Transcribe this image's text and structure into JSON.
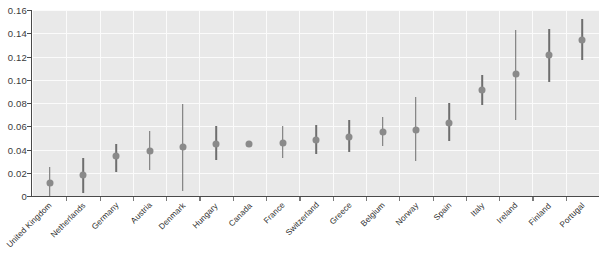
{
  "chart_data": {
    "type": "scatter",
    "title": "",
    "subtitle": "",
    "xlabel": "",
    "ylabel": "",
    "ylim": [
      0,
      0.16
    ],
    "ytick_labels": [
      "0",
      "0.02",
      "0.04",
      "0.06",
      "0.08",
      "0.10",
      "0.12",
      "0.14",
      "0.16"
    ],
    "ytick_values": [
      0,
      0.02,
      0.04,
      0.06,
      0.08,
      0.1,
      0.12,
      0.14,
      0.16
    ],
    "grid": true,
    "legend": "none",
    "categories": [
      "United Kingdom",
      "Netherlands",
      "Germany",
      "Austria",
      "Denmark",
      "Hungary",
      "Canada",
      "France",
      "Switzerland",
      "Greece",
      "Belgium",
      "Norway",
      "Spain",
      "Italy",
      "Ireland",
      "Finland",
      "Portugal"
    ],
    "values": [
      0.011,
      0.018,
      0.034,
      0.039,
      0.042,
      0.045,
      0.045,
      0.046,
      0.048,
      0.051,
      0.055,
      0.057,
      0.063,
      0.091,
      0.105,
      0.121,
      0.134
    ],
    "error_low": [
      0.0,
      0.003,
      0.021,
      0.022,
      0.004,
      0.031,
      0.043,
      0.033,
      0.036,
      0.038,
      0.043,
      0.03,
      0.047,
      0.078,
      0.065,
      0.098,
      0.117
    ],
    "error_high": [
      0.025,
      0.033,
      0.045,
      0.056,
      0.079,
      0.06,
      0.047,
      0.06,
      0.061,
      0.065,
      0.068,
      0.085,
      0.08,
      0.104,
      0.143,
      0.144,
      0.152
    ],
    "series": [
      {
        "name": "estimate",
        "values": [
          0.011,
          0.018,
          0.034,
          0.039,
          0.042,
          0.045,
          0.045,
          0.046,
          0.048,
          0.051,
          0.055,
          0.057,
          0.063,
          0.091,
          0.105,
          0.121,
          0.134
        ]
      }
    ],
    "point_color": "#8a8a8a",
    "errorbar_color": "#6e6e6e",
    "panel_color": "#e9e9e9",
    "grid_color": "#fbfbfb",
    "axis_color": "#4a4a4a"
  },
  "caption": ""
}
